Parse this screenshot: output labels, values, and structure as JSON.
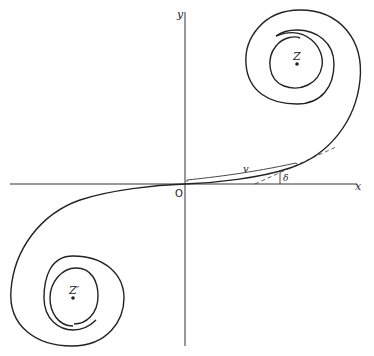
{
  "diagram": {
    "labels": {
      "y_axis": "y",
      "x_axis": "x",
      "origin": "O",
      "arc_length": "v",
      "angle": "δ",
      "upper_limit_point": "Z",
      "lower_limit_point": "Z′"
    },
    "colors": {
      "stroke": "#222222",
      "background": "#ffffff"
    }
  }
}
